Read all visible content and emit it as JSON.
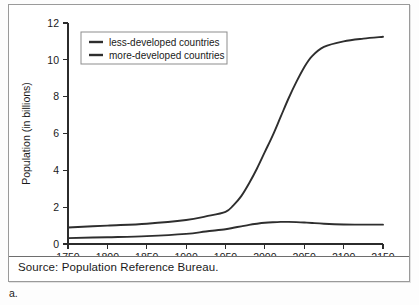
{
  "figure": {
    "letter": "a.",
    "source": "Source: Population Reference Bureau."
  },
  "chart_data": {
    "type": "line",
    "title": "",
    "xlabel": "",
    "ylabel": "Population (in billions)",
    "xlim": [
      1750,
      2150
    ],
    "ylim": [
      0,
      12
    ],
    "xticks": [
      1750,
      1800,
      1850,
      1900,
      1950,
      2000,
      2050,
      2100,
      2150
    ],
    "xticklabels": [
      "1750",
      "1800",
      "1850",
      "1900",
      "1950",
      "2000",
      "2050",
      "2100",
      "2150"
    ],
    "yticks": [
      0,
      2,
      4,
      6,
      8,
      10,
      12
    ],
    "yticklabels": [
      "0",
      "2",
      "4",
      "6",
      "8",
      "10",
      "12"
    ],
    "grid": false,
    "legend_position": "upper-left",
    "x": [
      1750,
      1800,
      1850,
      1900,
      1925,
      1950,
      1960,
      1970,
      1980,
      1990,
      2000,
      2010,
      2020,
      2030,
      2040,
      2050,
      2060,
      2075,
      2100,
      2125,
      2150
    ],
    "series": [
      {
        "name": "less-developed countries",
        "label": "less-developed countries",
        "color": "#2e2e2e",
        "values": [
          0.9,
          1.0,
          1.1,
          1.3,
          1.5,
          1.75,
          2.1,
          2.6,
          3.3,
          4.1,
          5.0,
          5.9,
          6.9,
          7.9,
          8.8,
          9.6,
          10.2,
          10.7,
          11.0,
          11.15,
          11.25
        ]
      },
      {
        "name": "more-developed countries",
        "label": "more-developed countries",
        "color": "#2e2e2e",
        "values": [
          0.32,
          0.37,
          0.43,
          0.55,
          0.68,
          0.8,
          0.88,
          0.96,
          1.04,
          1.1,
          1.15,
          1.18,
          1.2,
          1.2,
          1.19,
          1.17,
          1.14,
          1.1,
          1.06,
          1.05,
          1.05
        ]
      }
    ]
  }
}
